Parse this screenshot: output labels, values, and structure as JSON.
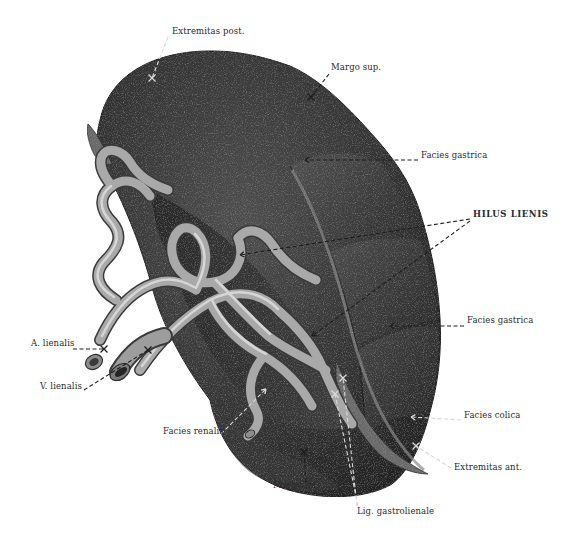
{
  "figure": {
    "background": "#ffffff",
    "colors": {
      "organ_dark": "#2b2b2b",
      "organ_mid": "#4a4a4a",
      "organ_light": "#6e6e6e",
      "vessel_light": "#b9b9b9",
      "vessel_mid": "#8a8a8a",
      "vessel_dark": "#4f4f4f",
      "leader_line": "#1e1e1e",
      "leader_line_on_dark": "#d8d8d8",
      "label_text": "#2a2a2a"
    }
  },
  "labels": [
    {
      "id": "extremitas-post",
      "text": "Extremitas post.",
      "x": 172,
      "y": 34
    },
    {
      "id": "margo-sup",
      "text": "Margo sup.",
      "x": 331,
      "y": 70
    },
    {
      "id": "facies-gastrica-upper",
      "text": "Facies gastrica",
      "x": 421,
      "y": 158
    },
    {
      "id": "hilus-lienis",
      "text": "HILUS LIENIS",
      "x": 473,
      "y": 217,
      "caps": true
    },
    {
      "id": "facies-gastrica-lower",
      "text": "Facies gastrica",
      "x": 467,
      "y": 323
    },
    {
      "id": "a-lienalis",
      "text": "A. lienalis",
      "x": 31,
      "y": 346
    },
    {
      "id": "v-lienalis",
      "text": "V. lienalis",
      "x": 40,
      "y": 389
    },
    {
      "id": "facies-colica",
      "text": "Facies colica",
      "x": 464,
      "y": 418
    },
    {
      "id": "facies-renalis",
      "text": "Facies renalis",
      "x": 163,
      "y": 434
    },
    {
      "id": "extremitas-ant",
      "text": "Extremitas ant.",
      "x": 454,
      "y": 470
    },
    {
      "id": "margo-inf",
      "text": "Margo inf.",
      "x": 273,
      "y": 488
    },
    {
      "id": "lig-gastrolienale",
      "text": "Lig. gastrolienale",
      "x": 357,
      "y": 514
    }
  ],
  "leaders": [
    {
      "for": "extremitas-post",
      "points": [
        [
          168,
          37
        ],
        [
          152,
          78
        ]
      ],
      "marker": "cross",
      "marker_at": [
        152,
        78
      ],
      "tone": "light_on_dark"
    },
    {
      "for": "margo-sup",
      "points": [
        [
          329,
          74
        ],
        [
          311,
          97
        ]
      ],
      "marker": "cross",
      "marker_at": [
        311,
        97
      ],
      "tone": "mixed"
    },
    {
      "for": "facies-gastrica-upper",
      "points": [
        [
          418,
          160
        ],
        [
          305,
          160
        ]
      ],
      "marker": "arrow",
      "marker_at": [
        305,
        160
      ],
      "tone": "dark"
    },
    {
      "for": "hilus-lienis-a",
      "points": [
        [
          470,
          219
        ],
        [
          240,
          255
        ]
      ],
      "marker": "arrow",
      "marker_at": [
        240,
        255
      ],
      "tone": "dark"
    },
    {
      "for": "hilus-lienis-b",
      "points": [
        [
          470,
          221
        ],
        [
          312,
          336
        ]
      ],
      "marker": "arrow",
      "marker_at": [
        312,
        336
      ],
      "tone": "dark"
    },
    {
      "for": "facies-gastrica-lower",
      "points": [
        [
          464,
          326
        ],
        [
          390,
          326
        ]
      ],
      "marker": "arrow",
      "marker_at": [
        390,
        326
      ],
      "tone": "dark"
    },
    {
      "for": "a-lienalis",
      "points": [
        [
          73,
          349
        ],
        [
          104,
          349
        ]
      ],
      "marker": "cross",
      "marker_at": [
        104,
        349
      ],
      "tone": "dark"
    },
    {
      "for": "v-lienalis",
      "points": [
        [
          84,
          390
        ],
        [
          148,
          350
        ]
      ],
      "marker": "cross",
      "marker_at": [
        148,
        350
      ],
      "tone": "dark"
    },
    {
      "for": "facies-colica",
      "points": [
        [
          461,
          420
        ],
        [
          411,
          417
        ]
      ],
      "marker": "arrow",
      "marker_at": [
        411,
        417
      ],
      "tone": "light_on_dark"
    },
    {
      "for": "facies-renalis",
      "points": [
        [
          221,
          434
        ],
        [
          266,
          389
        ]
      ],
      "marker": "arrow",
      "marker_at": [
        266,
        389
      ],
      "tone": "light_on_dark"
    },
    {
      "for": "extremitas-ant",
      "points": [
        [
          451,
          468
        ],
        [
          416,
          446
        ]
      ],
      "marker": "cross",
      "marker_at": [
        416,
        446
      ],
      "tone": "light_on_dark"
    },
    {
      "for": "margo-inf",
      "points": [
        [
          306,
          482
        ],
        [
          304,
          452
        ]
      ],
      "marker": "cross",
      "marker_at": [
        304,
        452
      ],
      "tone": "dark"
    },
    {
      "for": "lig-gastrolienale-a",
      "points": [
        [
          357,
          506
        ],
        [
          343,
          378
        ]
      ],
      "marker": "cross",
      "marker_at": [
        343,
        378
      ],
      "tone": "light_on_dark"
    },
    {
      "for": "lig-gastrolienale-b",
      "points": [
        [
          358,
          506
        ],
        [
          335,
          394
        ]
      ],
      "marker": "cross",
      "marker_at": [
        335,
        394
      ],
      "tone": "light_on_dark"
    }
  ]
}
